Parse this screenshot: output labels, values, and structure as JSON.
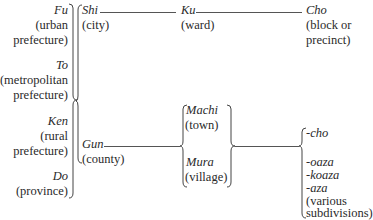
{
  "diagram": {
    "prefectures": [
      {
        "term": "Fu",
        "gloss": [
          "(urban",
          "prefecture)"
        ]
      },
      {
        "term": "To",
        "gloss": [
          "(metropolitan",
          "prefecture)"
        ]
      },
      {
        "term": "Ken",
        "gloss": [
          "(rural",
          "prefecture)"
        ]
      },
      {
        "term": "Do",
        "gloss": [
          "(province)"
        ]
      }
    ],
    "level2": [
      {
        "term": "Shi",
        "gloss": "(city)"
      },
      {
        "term": "Gun",
        "gloss": "(county)"
      }
    ],
    "city_branch": {
      "ward": {
        "term": "Ku",
        "gloss": "(ward)"
      },
      "block": {
        "term": "Cho",
        "gloss": [
          "(block or",
          "precinct)"
        ]
      }
    },
    "county_branch": {
      "towns": [
        {
          "term": "Machi",
          "gloss": "(town)"
        },
        {
          "term": "Mura",
          "gloss": "(village)"
        }
      ],
      "subdivisions": {
        "items": [
          "-cho",
          "-oaza",
          "-koaza",
          "-aza"
        ],
        "gloss": [
          "(various",
          "subdivisions)"
        ]
      }
    }
  }
}
